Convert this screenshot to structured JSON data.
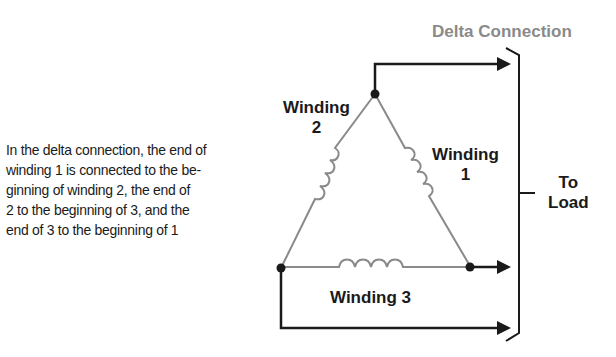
{
  "title": "Delta Connection",
  "caption": {
    "lines": [
      "In the delta connection, the end of",
      "winding 1 is connected to the be-",
      "ginning of winding 2, the end of",
      "2 to the beginning of 3, and the",
      "end of 3 to the beginning of 1"
    ]
  },
  "windings": [
    {
      "id": 1,
      "label_line1": "Winding",
      "label_line2": "1"
    },
    {
      "id": 2,
      "label_line1": "Winding",
      "label_line2": "2"
    },
    {
      "id": 3,
      "label": "Winding 3"
    }
  ],
  "load": {
    "line1": "To",
    "line2": "Load"
  },
  "colors": {
    "wire": "#1a1a1a",
    "winding": "#8a8a8a",
    "title": "#8a8a8a"
  }
}
